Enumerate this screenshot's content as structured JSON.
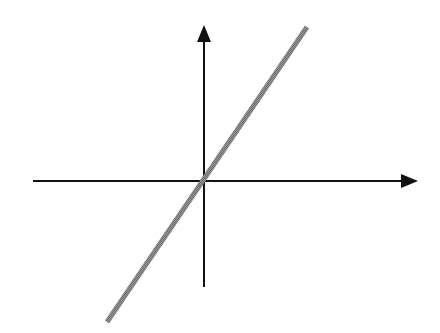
{
  "diagram": {
    "type": "coordinate-axes-with-line",
    "colors": {
      "background": "#ffffff",
      "axis": "#111111",
      "line": "#8a8a8a",
      "line_hatch": "#5a5a5a"
    },
    "x_axis": {
      "x1": 33,
      "y": 181,
      "x2": 418,
      "arrow": "right"
    },
    "y_axis": {
      "x": 204,
      "y1": 287,
      "y2": 25,
      "arrow": "up"
    },
    "origin": {
      "x": 204,
      "y": 181
    },
    "line": {
      "x1": 107,
      "y1": 322,
      "x2": 307,
      "y2": 27,
      "width": 5,
      "slope": "positive"
    }
  }
}
